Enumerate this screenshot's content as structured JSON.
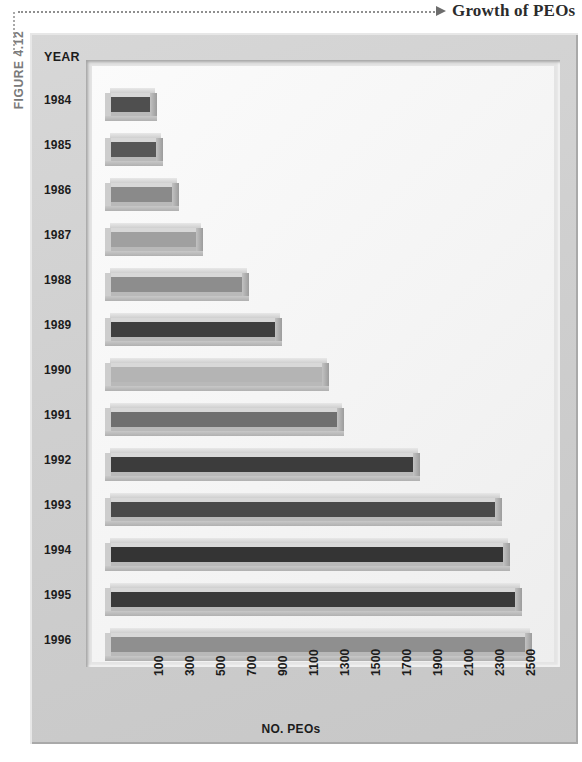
{
  "caption": {
    "figure_label": "FIGURE 4.12",
    "title": "Growth of PEOs",
    "lead_icon": "dotted-arrow-icon"
  },
  "panel": {
    "year_header": "YEAR"
  },
  "chart_data": {
    "type": "bar",
    "orientation": "horizontal",
    "title": "Growth of PEOs",
    "xlabel": "NO. PEOs",
    "ylabel": "YEAR",
    "categories": [
      "1984",
      "1985",
      "1986",
      "1987",
      "1988",
      "1989",
      "1990",
      "1991",
      "1992",
      "1993",
      "1994",
      "1995",
      "1996"
    ],
    "values": [
      120,
      160,
      265,
      420,
      715,
      930,
      1230,
      1330,
      1820,
      2350,
      2400,
      2475,
      2545
    ],
    "xticks": [
      100,
      300,
      500,
      700,
      900,
      1100,
      1300,
      1500,
      1700,
      1900,
      2100,
      2300,
      2500
    ],
    "xlim": [
      0,
      2600
    ],
    "grid": false,
    "legend": false,
    "bar_colors": [
      "#4f4f4f",
      "#575757",
      "#8a8a8a",
      "#a0a0a0",
      "#8d8d8d",
      "#3f3f3f",
      "#b4b4b4",
      "#6f6f6f",
      "#3c3c3c",
      "#4a4a4a",
      "#343434",
      "#3a3a3a",
      "#8f8f8f"
    ]
  },
  "colors": {
    "plaque": "#cfcfcf",
    "plot_bg": "#f6f6f6",
    "text": "#1c1c1c",
    "caption_text": "#2b2b2b",
    "figure_label": "#7a7a7a"
  }
}
